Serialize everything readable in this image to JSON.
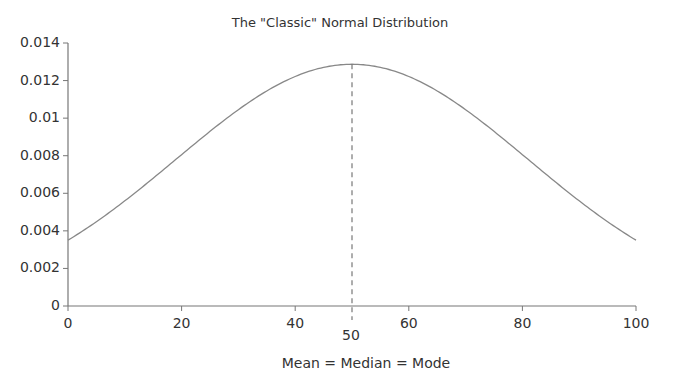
{
  "chart_data": {
    "type": "line",
    "title": "The \"Classic\" Normal Distribution",
    "xlabel": "Mean = Median = Mode",
    "ylabel": "",
    "xlim": [
      0,
      100
    ],
    "ylim": [
      0,
      0.014
    ],
    "x_ticks": [
      0,
      20,
      40,
      60,
      80,
      100
    ],
    "y_ticks": [
      "0",
      "0.002",
      "0.004",
      "0.006",
      "0.008",
      "0.01",
      "0.012",
      "0.014"
    ],
    "annotation": {
      "x": 50,
      "label": "50",
      "style": "dashed vertical line"
    },
    "grid": false,
    "legend": null,
    "series": [
      {
        "name": "Normal distribution (mean 50, sd ~31)",
        "mean": 50,
        "sd": 31,
        "x": [
          0,
          10,
          20,
          30,
          40,
          50,
          60,
          70,
          80,
          90,
          100
        ],
        "values": [
          0.0035,
          0.0056,
          0.0081,
          0.0105,
          0.0122,
          0.0129,
          0.0122,
          0.0105,
          0.0081,
          0.0056,
          0.0035
        ]
      }
    ]
  }
}
